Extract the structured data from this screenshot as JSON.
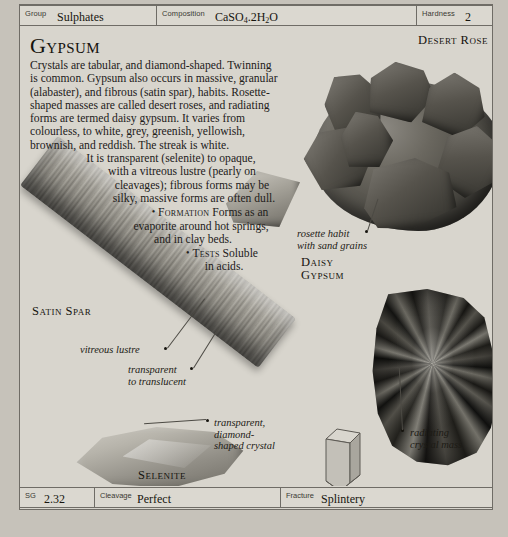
{
  "header": {
    "fields": [
      {
        "key": "Group",
        "value": "Sulphates"
      },
      {
        "key": "Composition",
        "value_main": "CaSO",
        "value_sub": "4",
        "value_tail": ".2H",
        "value_sub2": "2",
        "value_tail2": "O",
        "value": "CaSO4.2H2O"
      },
      {
        "key": "Hardness",
        "value": "2"
      }
    ]
  },
  "footer": {
    "fields": [
      {
        "key": "SG",
        "value": "2.32"
      },
      {
        "key": "Cleavage",
        "value": "Perfect"
      },
      {
        "key": "Fracture",
        "value": "Splintery"
      }
    ]
  },
  "main": {
    "title": "Gypsum",
    "description_lines": [
      "Crystals are tabular, and diamond-shaped. Twinning",
      "is common. Gypsum also occurs in massive, granular",
      "(alabaster), and fibrous (satin spar), habits. Rosette-",
      "shaped masses are called desert roses, and radiating",
      "forms are termed daisy gypsum. It varies from",
      "colourless, to white, grey, greenish, yellowish,",
      "brownish, and reddish. The streak is white.",
      "It is transparent (selenite) to opaque,",
      "with a vitreous lustre (pearly on",
      "cleavages); fibrous forms may be",
      "silky, massive forms are often dull."
    ],
    "formation": {
      "bullet": "•",
      "label": "Formation",
      "lines": [
        "Forms as an",
        "evaporite around hot springs,",
        "and in clay beds."
      ]
    },
    "tests": {
      "bullet": "•",
      "label": "Tests",
      "lines": [
        "Soluble",
        "in acids."
      ]
    }
  },
  "specimens": {
    "desert_rose": {
      "label": "Desert Rose",
      "annotation_lines": [
        "rosette habit",
        "with sand grains"
      ]
    },
    "daisy_gypsum": {
      "label_lines": [
        "Daisy",
        "Gypsum"
      ],
      "annotation_lines": [
        "radiating",
        "crystal mass"
      ]
    },
    "satin_spar": {
      "label": "Satin Spar",
      "annotation_lustre": "vitreous lustre",
      "annotation_transparency_lines": [
        "transparent",
        "to translucent"
      ]
    },
    "selenite": {
      "label": "Selenite",
      "annotation_lines": [
        "transparent,",
        "diamond-",
        "shaped crystal"
      ]
    },
    "crystal_system": {
      "label": "Monoclinic"
    }
  },
  "colors": {
    "page_background": "#c6c2ba",
    "sheet_background": "#d8d5cd",
    "rule": "#6f6c66",
    "text": "#17150f"
  }
}
